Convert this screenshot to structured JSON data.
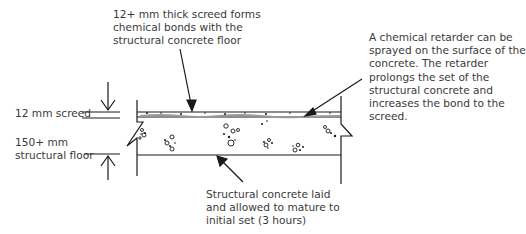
{
  "diagram": {
    "type": "cross-section",
    "labels": {
      "top_callout": [
        "12+ mm thick screed forms",
        "chemical bonds with the",
        "structural concrete floor"
      ],
      "right_callout": [
        "A chemical retarder can be",
        "sprayed on the surface of the",
        "concrete. The retarder",
        "prolongs the set of the",
        "structural concrete and",
        "increases the bond to the",
        "screed."
      ],
      "bottom_callout": [
        "Structural concrete laid",
        "and allowed to mature to",
        "initial set (3 hours)"
      ],
      "screed_dimension": "12 mm screed",
      "floor_dimension": [
        "150+ mm",
        "structural floor"
      ]
    },
    "layers": [
      {
        "name": "screed",
        "thickness": "12 mm"
      },
      {
        "name": "structural floor",
        "thickness": "150+ mm"
      }
    ],
    "colors": {
      "line": "#1a1a1a",
      "text": "#3a3a3a",
      "retarder": "#9a9a9a"
    }
  }
}
